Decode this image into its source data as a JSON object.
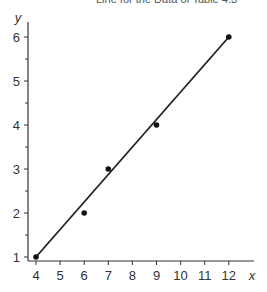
{
  "caption": "Line for the Data of Table 4.3",
  "chart_data": {
    "type": "scatter",
    "title": "Line for the Data of Table 4.3",
    "xlabel": "x",
    "ylabel": "y",
    "xlim": [
      4,
      12.5
    ],
    "ylim": [
      1,
      6
    ],
    "x_ticks": [
      4,
      5,
      6,
      7,
      8,
      9,
      10,
      11,
      12
    ],
    "y_ticks": [
      1,
      2,
      3,
      4,
      5,
      6
    ],
    "y_minor_ticks": [
      1.5,
      2.5,
      3.5,
      4.5,
      5.5
    ],
    "grid": false,
    "series": [
      {
        "name": "data points",
        "type": "scatter",
        "x": [
          4,
          6,
          7,
          9,
          12
        ],
        "y": [
          1,
          2,
          3,
          4,
          6
        ]
      },
      {
        "name": "fitted line",
        "type": "line",
        "x": [
          4,
          12
        ],
        "y": [
          1,
          6
        ]
      }
    ]
  }
}
